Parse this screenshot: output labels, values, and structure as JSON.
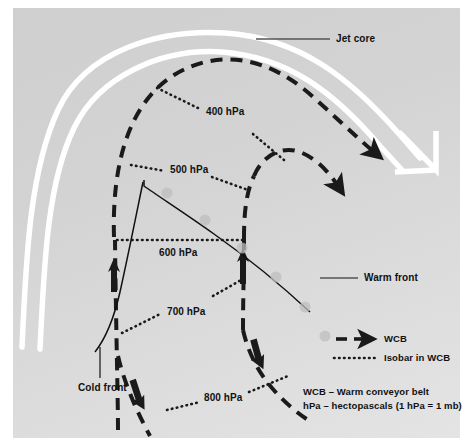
{
  "figure": {
    "type": "meteorological-schematic",
    "title_visible": false,
    "background_color": "#d6d6d6",
    "panel_border_color": "#ffffff"
  },
  "annotations": {
    "jet_core": "Jet core",
    "warm_front": "Warm front",
    "cold_front": "Cold front"
  },
  "isobars": [
    {
      "label": "400 hPa",
      "value": 400,
      "unit": "hPa"
    },
    {
      "label": "500 hPa",
      "value": 500,
      "unit": "hPa"
    },
    {
      "label": "600 hPa",
      "value": 600,
      "unit": "hPa"
    },
    {
      "label": "700 hPa",
      "value": 700,
      "unit": "hPa"
    },
    {
      "label": "800 hPa",
      "value": 800,
      "unit": "hPa"
    }
  ],
  "legend": {
    "items": [
      {
        "key": "wcb",
        "label": "WCB",
        "symbol": "dashed-arrow",
        "color": "#1a1a1a"
      },
      {
        "key": "isobar",
        "label": "Isobar in WCB",
        "symbol": "dotted-line",
        "color": "#1a1a1a"
      }
    ],
    "notes": [
      "WCB – Warm conveyor belt",
      "hPa – hectopascals (1 hPa = 1 mb)"
    ]
  },
  "colors": {
    "jet_stream": "#ffffff",
    "wcb_dashed": "#1a1a1a",
    "isobar_dotted": "#1a1a1a",
    "front_line": "#111111",
    "leader_line": "#555555",
    "front_bump": "#b9b9b9"
  }
}
